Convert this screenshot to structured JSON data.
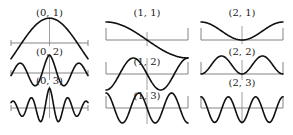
{
  "figure": {
    "width": 293,
    "height": 135,
    "colors": {
      "curve": "#111111",
      "axis": "#777777",
      "label": "#222222",
      "background": "#ffffff"
    },
    "panels": [
      {
        "id": "p01",
        "label": "(0, 1)",
        "x0": 11,
        "x1": 88,
        "axisY": 43,
        "labelY": 16,
        "amp": 27,
        "kind": "bell",
        "k": 1,
        "boxed": false,
        "vTop": 18,
        "vBot": 46
      },
      {
        "id": "p02",
        "label": "(0, 2)",
        "x0": 11,
        "x1": 88,
        "axisY": 73,
        "labelY": 55,
        "amp": 18,
        "kind": "bessel",
        "k": 2,
        "boxed": false,
        "vTop": 56,
        "vBot": 80
      },
      {
        "id": "p03",
        "label": "(0, 3)",
        "x0": 11,
        "x1": 88,
        "axisY": 108,
        "labelY": 84,
        "amp": 20,
        "kind": "bessel",
        "k": 3,
        "boxed": false,
        "vTop": 86,
        "vBot": 118
      },
      {
        "id": "p11",
        "label": "(1, 1)",
        "x0": 106,
        "x1": 188,
        "axisY": 40,
        "labelY": 16,
        "amp": 18,
        "kind": "odd",
        "k": 1,
        "boxed": true,
        "vTop": 32,
        "vBot": 46
      },
      {
        "id": "p12",
        "label": "(1, 2)",
        "x0": 106,
        "x1": 188,
        "axisY": 74,
        "labelY": 65,
        "amp": 16,
        "kind": "odd",
        "k": 2,
        "boxed": true,
        "vTop": 58,
        "vBot": 90
      },
      {
        "id": "p13",
        "label": "(1, 3)",
        "x0": 106,
        "x1": 188,
        "axisY": 108,
        "labelY": 99,
        "amp": 15,
        "kind": "odd",
        "k": 3,
        "boxed": true,
        "vTop": 92,
        "vBot": 124
      },
      {
        "id": "p21",
        "label": "(2, 1)",
        "x0": 201,
        "x1": 283,
        "axisY": 40,
        "labelY": 16,
        "amp": 18,
        "kind": "even",
        "k": 1,
        "boxed": true,
        "vTop": 26,
        "vBot": 44
      },
      {
        "id": "p22",
        "label": "(2, 2)",
        "x0": 201,
        "x1": 283,
        "axisY": 74,
        "labelY": 55,
        "amp": 18,
        "kind": "even",
        "k": 2,
        "boxed": true,
        "vTop": 60,
        "vBot": 80
      },
      {
        "id": "p23",
        "label": "(2, 3)",
        "x0": 201,
        "x1": 283,
        "axisY": 108,
        "labelY": 86,
        "amp": 16,
        "kind": "even",
        "k": 3,
        "boxed": true,
        "vTop": 92,
        "vBot": 124
      }
    ]
  }
}
